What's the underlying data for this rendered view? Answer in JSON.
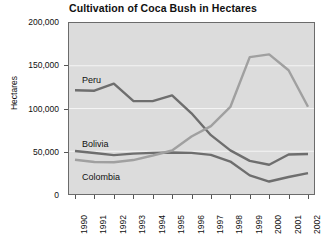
{
  "chart_data": {
    "type": "line",
    "title": "Cultivation of Coca Bush in Hectares",
    "xlabel": "",
    "ylabel": "Hectares",
    "categories": [
      "1990",
      "1991",
      "1992",
      "1993",
      "1994",
      "1995",
      "1996",
      "1997",
      "1998",
      "1999",
      "2000",
      "2001",
      "2002"
    ],
    "ylim": [
      0,
      200000
    ],
    "y_ticks": [
      0,
      50000,
      100000,
      150000,
      200000
    ],
    "y_tick_labels": [
      "0",
      "50,000",
      "100,000",
      "150,000",
      "200,000"
    ],
    "grid": true,
    "legend_position": "inline-labels",
    "series": [
      {
        "name": "Peru",
        "color": "#6e6e6e",
        "values": [
          121300,
          120800,
          129100,
          108800,
          108600,
          115300,
          94400,
          68800,
          51000,
          38700,
          34200,
          46200,
          46700
        ]
      },
      {
        "name": "Bolivia",
        "color": "#6e6e6e",
        "values": [
          50300,
          47900,
          45500,
          47200,
          48100,
          48600,
          48100,
          45800,
          38000,
          21800,
          14600,
          19900,
          24400
        ]
      },
      {
        "name": "Colombia",
        "color": "#a0a0a0",
        "values": [
          40100,
          37500,
          37100,
          39700,
          45000,
          50900,
          67200,
          79400,
          101800,
          160100,
          163300,
          144800,
          102000
        ]
      }
    ]
  },
  "axis": {
    "y_title": "Hectares"
  },
  "labels": {
    "peru": "Peru",
    "bolivia": "Bolivia",
    "colombia": "Colombia"
  }
}
